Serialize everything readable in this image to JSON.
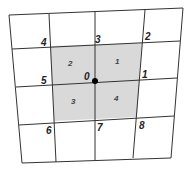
{
  "diagram": {
    "type": "quadrilateral mesh with node and element numbering",
    "center_node": {
      "label": "0",
      "x": 95,
      "y": 81
    },
    "nodes": [
      {
        "label": "1",
        "x": 140,
        "y": 80
      },
      {
        "label": "2",
        "x": 143,
        "y": 43
      },
      {
        "label": "3",
        "x": 95,
        "y": 45
      },
      {
        "label": "4",
        "x": 50,
        "y": 46
      },
      {
        "label": "5",
        "x": 52,
        "y": 84
      },
      {
        "label": "6",
        "x": 54,
        "y": 121
      },
      {
        "label": "7",
        "x": 95,
        "y": 119
      },
      {
        "label": "8",
        "x": 137,
        "y": 117
      }
    ],
    "elements": [
      {
        "label": "1",
        "x": 117,
        "y": 63
      },
      {
        "label": "2",
        "x": 70,
        "y": 65
      },
      {
        "label": "3",
        "x": 73,
        "y": 103
      },
      {
        "label": "4",
        "x": 116,
        "y": 100
      }
    ],
    "colors": {
      "shade": "#d9d9d9",
      "line": "#333333",
      "node": "#000000"
    }
  }
}
